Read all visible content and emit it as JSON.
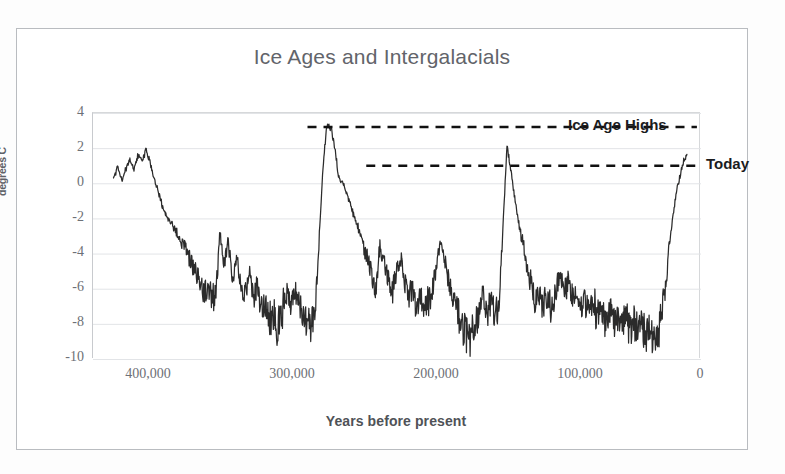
{
  "chart_data": {
    "type": "line",
    "title": "Ice Ages and Intergalacials",
    "xlabel": "Years before present",
    "ylabel": "degrees C",
    "xlim": [
      440000,
      -5000
    ],
    "ylim": [
      -10,
      4
    ],
    "x_reversed": true,
    "grid": true,
    "legend": "none",
    "x_ticks": [
      "400,000",
      "300,000",
      "200,000",
      "100,000",
      "0"
    ],
    "x_tick_values": [
      400000,
      300000,
      200000,
      100000,
      0
    ],
    "y_ticks": [
      "4",
      "2",
      "0",
      "-2",
      "-4",
      "-6",
      "-8",
      "-10"
    ],
    "y_tick_values": [
      4,
      2,
      0,
      -2,
      -4,
      -6,
      -8,
      -10
    ],
    "series_name": "Ice core temperature anomaly",
    "line_color": "#2b2b2b",
    "annotations": [
      {
        "name": "ice-age-highs",
        "label": "Ice Age Highs",
        "style": "dashed-horizontal-line",
        "y_value": 3.2,
        "x_start": 283000,
        "x_end": -2000,
        "color": "#111111"
      },
      {
        "name": "today",
        "label": "Today",
        "style": "dashed-horizontal-line",
        "y_value": 1.0,
        "x_start": 240000,
        "x_end": -2000,
        "color": "#111111"
      }
    ],
    "x": [
      425000,
      422000,
      419000,
      416000,
      413000,
      410000,
      407000,
      404000,
      401000,
      398000,
      395000,
      392000,
      389000,
      386000,
      383000,
      380000,
      377000,
      374000,
      371000,
      368000,
      365000,
      362000,
      359000,
      356000,
      353000,
      350000,
      347000,
      344000,
      341000,
      338000,
      335000,
      332000,
      329000,
      326000,
      323000,
      320000,
      317000,
      314000,
      311000,
      308000,
      305000,
      302000,
      299000,
      296000,
      293000,
      290000,
      287000,
      284000,
      281000,
      278000,
      275000,
      272000,
      269000,
      266000,
      263000,
      260000,
      257000,
      254000,
      251000,
      248000,
      245000,
      242000,
      239000,
      236000,
      233000,
      230000,
      227000,
      224000,
      221000,
      218000,
      215000,
      212000,
      209000,
      206000,
      203000,
      200000,
      197000,
      194000,
      191000,
      188000,
      185000,
      182000,
      179000,
      176000,
      173000,
      170000,
      167000,
      164000,
      161000,
      158000,
      155000,
      152000,
      149000,
      146000,
      143000,
      140000,
      137000,
      134000,
      131000,
      128000,
      125000,
      122000,
      119000,
      116000,
      113000,
      110000,
      107000,
      104000,
      101000,
      98000,
      95000,
      92000,
      89000,
      86000,
      83000,
      80000,
      77000,
      74000,
      71000,
      68000,
      65000,
      62000,
      59000,
      56000,
      53000,
      50000,
      47000,
      44000,
      41000,
      38000,
      35000,
      32000,
      29000,
      26000,
      23000,
      20000,
      17000,
      14000,
      11000,
      8000,
      5000,
      2000,
      0
    ],
    "y": [
      0.4,
      0.9,
      0.2,
      0.8,
      1.4,
      0.9,
      1.6,
      1.2,
      2.0,
      1.1,
      0.2,
      -0.6,
      -1.3,
      -1.9,
      -2.3,
      -2.6,
      -3.1,
      -3.5,
      -3.9,
      -4.4,
      -5.0,
      -5.6,
      -6.2,
      -6.0,
      -6.6,
      -6.2,
      -2.8,
      -4.6,
      -3.4,
      -5.4,
      -4.0,
      -5.6,
      -6.4,
      -5.2,
      -6.6,
      -6.0,
      -7.2,
      -6.8,
      -7.9,
      -7.6,
      -8.1,
      -7.4,
      -6.4,
      -6.9,
      -6.1,
      -6.6,
      -7.1,
      -7.9,
      -8.0,
      -8.2,
      -4.0,
      0.6,
      3.2,
      3.2,
      2.0,
      0.3,
      0.0,
      -0.6,
      -1.4,
      -2.1,
      -2.8,
      -3.6,
      -4.4,
      -5.2,
      -6.0,
      -3.6,
      -4.6,
      -5.4,
      -6.2,
      -5.0,
      -4.2,
      -5.6,
      -6.4,
      -6.2,
      -7.0,
      -6.4,
      -7.2,
      -6.6,
      -5.8,
      -4.4,
      -3.2,
      -4.6,
      -5.8,
      -6.6,
      -7.4,
      -8.0,
      -8.4,
      -8.6,
      -8.1,
      -7.4,
      -6.4,
      -7.4,
      -6.8,
      -7.6,
      -7.2,
      -2.6,
      2.2,
      0.6,
      -1.0,
      -2.4,
      -3.6,
      -4.8,
      -6.0,
      -6.8,
      -6.2,
      -7.0,
      -6.4,
      -7.2,
      -6.0,
      -5.2,
      -6.2,
      -5.4,
      -6.6,
      -6.0,
      -7.0,
      -6.4,
      -7.4,
      -6.6,
      -7.6,
      -7.0,
      -7.8,
      -7.2,
      -8.0,
      -7.4,
      -8.2,
      -7.6,
      -8.4,
      -7.8,
      -8.6,
      -8.0,
      -8.8,
      -8.3,
      -9.0,
      -8.4,
      -7.0,
      -5.0,
      -2.6,
      -1.0,
      0.2,
      1.2,
      1.6
    ]
  },
  "labels": {
    "ice_age_highs": "Ice Age Highs",
    "today": "Today"
  }
}
